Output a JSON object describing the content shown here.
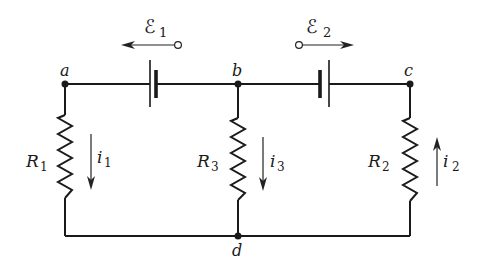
{
  "diagram": {
    "type": "circuit",
    "nodes": {
      "a": {
        "label": "a"
      },
      "b": {
        "label": "b"
      },
      "c": {
        "label": "c"
      },
      "d": {
        "label": "d"
      }
    },
    "emfs": [
      {
        "symbol": "ℰ",
        "subscript": "1",
        "direction": "left"
      },
      {
        "symbol": "ℰ",
        "subscript": "2",
        "direction": "right"
      }
    ],
    "resistors": [
      {
        "symbol": "R",
        "subscript": "1"
      },
      {
        "symbol": "R",
        "subscript": "3"
      },
      {
        "symbol": "R",
        "subscript": "2"
      }
    ],
    "currents": [
      {
        "symbol": "i",
        "subscript": "1",
        "direction": "down"
      },
      {
        "symbol": "i",
        "subscript": "3",
        "direction": "down"
      },
      {
        "symbol": "i",
        "subscript": "2",
        "direction": "up"
      }
    ]
  }
}
